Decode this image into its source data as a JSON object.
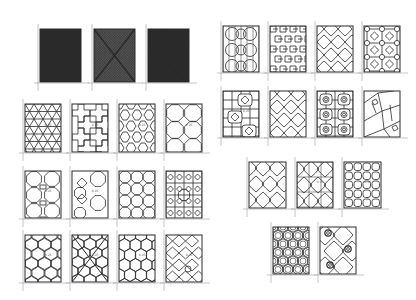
{
  "figure": {
    "line_color": "#2a2a2a",
    "dark_fill": "#2b2b2b",
    "mid_fill": "#555555",
    "groups": [
      {
        "name": "solid-samples",
        "panels": [
          {
            "id": "s1",
            "pattern": "dense-dark",
            "x": 40,
            "y": 29,
            "w": 41,
            "h": 53
          },
          {
            "id": "s2",
            "pattern": "dense-gray-cross",
            "x": 94,
            "y": 29,
            "w": 41,
            "h": 53
          },
          {
            "id": "s3",
            "pattern": "dense-dark",
            "x": 148,
            "y": 29,
            "w": 41,
            "h": 53
          }
        ]
      },
      {
        "name": "left-grid",
        "panels": [
          {
            "id": "L1",
            "pattern": "triangles",
            "x": 25,
            "y": 104,
            "w": 36,
            "h": 48,
            "label": "0.25"
          },
          {
            "id": "L2",
            "pattern": "crosses",
            "x": 72,
            "y": 104,
            "w": 36,
            "h": 48,
            "label": "0.25"
          },
          {
            "id": "L3",
            "pattern": "elongated-hex",
            "x": 119,
            "y": 104,
            "w": 36,
            "h": 48,
            "label": "0.25"
          },
          {
            "id": "L4",
            "pattern": "octagon-square",
            "x": 166,
            "y": 104,
            "w": 36,
            "h": 48,
            "label": "0.25"
          },
          {
            "id": "L5",
            "pattern": "octagon-small",
            "x": 25,
            "y": 171,
            "w": 36,
            "h": 47,
            "label": "0.25"
          },
          {
            "id": "L6",
            "pattern": "octagon-cross",
            "x": 72,
            "y": 171,
            "w": 36,
            "h": 47,
            "label": "0.25"
          },
          {
            "id": "L7",
            "pattern": "octagon-grid",
            "x": 119,
            "y": 171,
            "w": 36,
            "h": 47,
            "label": ""
          },
          {
            "id": "L8",
            "pattern": "diamond-grid",
            "x": 166,
            "y": 171,
            "w": 36,
            "h": 47,
            "label": ""
          },
          {
            "id": "L9",
            "pattern": "hexagons",
            "x": 25,
            "y": 235,
            "w": 36,
            "h": 47,
            "label": "0.25"
          },
          {
            "id": "L10",
            "pattern": "hex-diagonal",
            "x": 72,
            "y": 235,
            "w": 36,
            "h": 47,
            "label": "0.25"
          },
          {
            "id": "L11",
            "pattern": "hexagons-tall",
            "x": 119,
            "y": 235,
            "w": 36,
            "h": 47,
            "label": "0.25"
          },
          {
            "id": "L12",
            "pattern": "octagon-diag",
            "x": 166,
            "y": 235,
            "w": 36,
            "h": 47,
            "label": "0.25"
          }
        ]
      },
      {
        "name": "right-grid",
        "panels": [
          {
            "id": "R1",
            "pattern": "circle-cross",
            "x": 223,
            "y": 26,
            "w": 36,
            "h": 46,
            "label": ""
          },
          {
            "id": "R2",
            "pattern": "interlock-swirl",
            "x": 270,
            "y": 26,
            "w": 36,
            "h": 46,
            "label": ""
          },
          {
            "id": "R3",
            "pattern": "quatrefoil-diag",
            "x": 317,
            "y": 26,
            "w": 36,
            "h": 46,
            "label": ""
          },
          {
            "id": "R4",
            "pattern": "node-grid",
            "x": 364,
            "y": 26,
            "w": 36,
            "h": 46,
            "label": ""
          },
          {
            "id": "R5",
            "pattern": "grid-quatrefoil",
            "x": 223,
            "y": 91,
            "w": 36,
            "h": 46,
            "label": "0.25"
          },
          {
            "id": "R6",
            "pattern": "quatrefoil-diag",
            "x": 270,
            "y": 91,
            "w": 36,
            "h": 46,
            "label": ""
          },
          {
            "id": "R7",
            "pattern": "grid-rings",
            "x": 317,
            "y": 91,
            "w": 36,
            "h": 46,
            "label": ""
          },
          {
            "id": "R8",
            "pattern": "cracked-ice",
            "x": 364,
            "y": 91,
            "w": 36,
            "h": 46,
            "label": ""
          }
        ]
      },
      {
        "name": "middle-right-row",
        "panels": [
          {
            "id": "M1",
            "pattern": "wavy-quatrefoil",
            "x": 249,
            "y": 162,
            "w": 37,
            "h": 46,
            "label": ""
          },
          {
            "id": "M2",
            "pattern": "quatrefoil-grid",
            "x": 297,
            "y": 162,
            "w": 36,
            "h": 46,
            "label": "0.25"
          },
          {
            "id": "M3",
            "pattern": "wavy-squares",
            "x": 344,
            "y": 162,
            "w": 37,
            "h": 46,
            "label": "0.25"
          }
        ]
      },
      {
        "name": "bottom-right-row",
        "panels": [
          {
            "id": "B1",
            "pattern": "hex-rings",
            "x": 273,
            "y": 227,
            "w": 36,
            "h": 47,
            "label": ""
          },
          {
            "id": "B2",
            "pattern": "wavy-rings",
            "x": 320,
            "y": 227,
            "w": 36,
            "h": 47,
            "label": ""
          }
        ]
      }
    ]
  }
}
